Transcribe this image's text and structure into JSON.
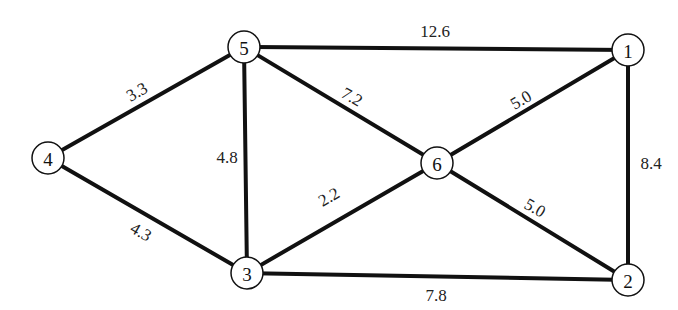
{
  "diagram": {
    "type": "weighted-undirected-graph",
    "nodes": [
      {
        "id": "1",
        "label": "1",
        "x": 628,
        "y": 50
      },
      {
        "id": "2",
        "label": "2",
        "x": 628,
        "y": 280
      },
      {
        "id": "3",
        "label": "3",
        "x": 247,
        "y": 273
      },
      {
        "id": "4",
        "label": "4",
        "x": 48,
        "y": 158
      },
      {
        "id": "5",
        "label": "5",
        "x": 244,
        "y": 47
      },
      {
        "id": "6",
        "label": "6",
        "x": 437,
        "y": 163
      }
    ],
    "edges": [
      {
        "from": "5",
        "to": "1",
        "weight": "12.6",
        "lx": 435,
        "ly": 31,
        "rot": 0
      },
      {
        "from": "4",
        "to": "5",
        "weight": "3.3",
        "lx": 137,
        "ly": 92,
        "rot": -30
      },
      {
        "from": "4",
        "to": "3",
        "weight": "4.3",
        "lx": 141,
        "ly": 232,
        "rot": 30
      },
      {
        "from": "5",
        "to": "3",
        "weight": "4.8",
        "lx": 227,
        "ly": 157,
        "rot": 0
      },
      {
        "from": "5",
        "to": "6",
        "weight": "7.2",
        "lx": 352,
        "ly": 97,
        "rot": 30
      },
      {
        "from": "3",
        "to": "6",
        "weight": "2.2",
        "lx": 329,
        "ly": 197,
        "rot": -30
      },
      {
        "from": "6",
        "to": "1",
        "weight": "5.0",
        "lx": 521,
        "ly": 100,
        "rot": -30
      },
      {
        "from": "6",
        "to": "2",
        "weight": "5.0",
        "lx": 535,
        "ly": 208,
        "rot": 30
      },
      {
        "from": "1",
        "to": "2",
        "weight": "8.4",
        "lx": 651,
        "ly": 163,
        "rot": 0
      },
      {
        "from": "3",
        "to": "2",
        "weight": "7.8",
        "lx": 436,
        "ly": 295,
        "rot": 0
      }
    ],
    "node_radius": 16,
    "colors": {
      "line": "#111111",
      "background": "#ffffff"
    }
  }
}
